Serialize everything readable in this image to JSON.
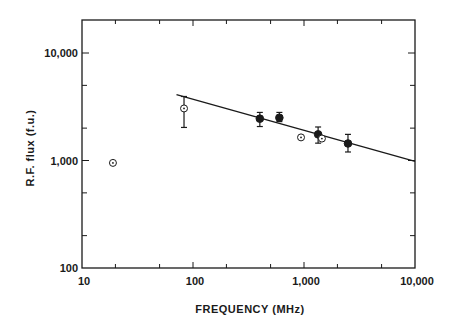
{
  "chart_data": {
    "type": "scatter",
    "title": "",
    "xlabel": "FREQUENCY (MHz)",
    "ylabel": "R.F. flux (f.u.)",
    "xscale": "log",
    "yscale": "log",
    "xlim": [
      10,
      10000
    ],
    "ylim": [
      100,
      20000
    ],
    "grid": false,
    "legend": null,
    "x_ticks": [
      10,
      100,
      1000,
      10000
    ],
    "x_tick_labels": [
      "10",
      "100",
      "1,000",
      "10,000"
    ],
    "y_ticks": [
      100,
      1000,
      10000
    ],
    "y_tick_labels": [
      "100",
      "1,000",
      "10,000"
    ],
    "series": [
      {
        "name": "filled points",
        "marker": "filled-circle",
        "points": [
          {
            "x": 400,
            "y": 2450,
            "err_low": 2070,
            "err_high": 2800
          },
          {
            "x": 600,
            "y": 2500,
            "err_low": 2300,
            "err_high": 2800
          },
          {
            "x": 1340,
            "y": 1750,
            "err_low": 1450,
            "err_high": 2050
          },
          {
            "x": 2490,
            "y": 1440,
            "err_low": 1200,
            "err_high": 1750
          }
        ]
      },
      {
        "name": "open points",
        "marker": "open-circle-dot",
        "points": [
          {
            "x": 19,
            "y": 950
          },
          {
            "x": 83,
            "y": 3050,
            "err_low": 2030,
            "err_high": 3940
          },
          {
            "x": 940,
            "y": 1640
          },
          {
            "x": 1450,
            "y": 1600
          }
        ]
      },
      {
        "name": "fit line",
        "type": "line",
        "points": [
          {
            "x": 71,
            "y": 4110
          },
          {
            "x": 10000,
            "y": 980
          }
        ]
      }
    ]
  }
}
